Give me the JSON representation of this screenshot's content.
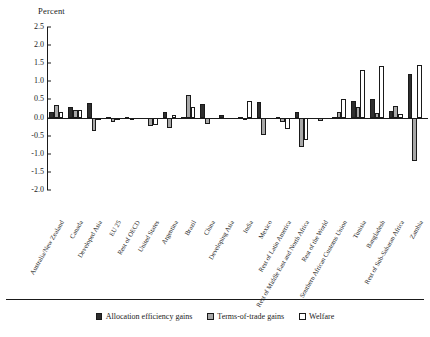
{
  "chart_data": {
    "type": "bar",
    "title": "",
    "ylabel": "Percent",
    "xlabel": "",
    "ylim": [
      -2.0,
      2.5
    ],
    "yticks": [
      2.5,
      2.0,
      1.5,
      1.0,
      0.5,
      0.0,
      -0.5,
      -1.0,
      -1.5,
      -2.0
    ],
    "ytick_labels": [
      "2.5",
      "2.0",
      "1.5",
      "1.0",
      "0.5",
      "0.0",
      "-0.5",
      "-1.0",
      "-1.5",
      "-2.0"
    ],
    "grid": false,
    "legend_position": "bottom-center",
    "categories": [
      "Australia/New Zealand",
      "Canada",
      "Developed Asia",
      "EU 25",
      "Rest of OECD",
      "United States",
      "Argentina",
      "Brazil",
      "China",
      "Developing Asia",
      "India",
      "Mexico",
      "Rest of Latin America",
      "Rest of Middle East and North Africa",
      "Rest of the World",
      "Southern African Customs Union",
      "Tunisia",
      "Bangladesh",
      "Rest of Sub-Saharan Africa",
      "Zambia"
    ],
    "series": [
      {
        "name": "Allocation efficiency gains",
        "color": "#2e2e2e",
        "values": [
          0.16,
          0.3,
          0.4,
          0.02,
          0.02,
          0.0,
          0.15,
          0.02,
          0.38,
          0.06,
          0.02,
          0.42,
          0.02,
          0.14,
          0.0,
          0.02,
          0.45,
          0.5,
          0.18,
          1.2
        ]
      },
      {
        "name": "Terms-of-trade gains",
        "color": "#a8a8a8",
        "values": [
          0.34,
          0.22,
          -0.38,
          -0.12,
          -0.08,
          -0.22,
          -0.28,
          0.62,
          -0.18,
          0.0,
          -0.02,
          -0.48,
          -0.12,
          -0.82,
          -0.1,
          0.14,
          0.28,
          0.12,
          0.32,
          -1.2
        ]
      },
      {
        "name": "Welfare",
        "color": "#ffffff",
        "values": [
          0.14,
          0.22,
          -0.08,
          -0.06,
          0.0,
          -0.2,
          0.08,
          0.28,
          0.0,
          0.0,
          0.46,
          0.0,
          -0.32,
          -0.62,
          0.0,
          0.52,
          1.3,
          1.42,
          0.1,
          1.45
        ]
      }
    ]
  },
  "legend": {
    "items": [
      {
        "label": "Allocation efficiency gains"
      },
      {
        "label": "Terms-of-trade gains"
      },
      {
        "label": "Welfare"
      }
    ]
  }
}
